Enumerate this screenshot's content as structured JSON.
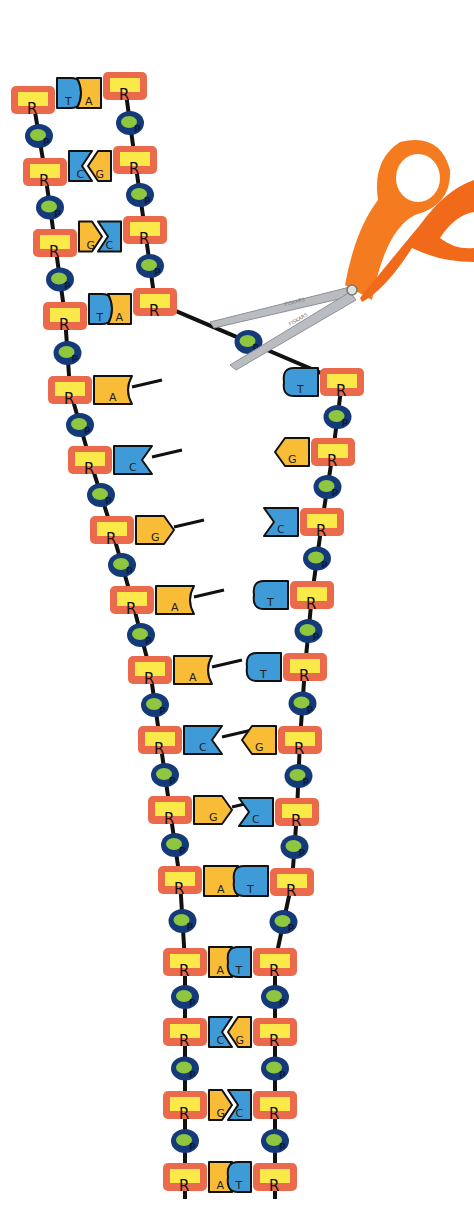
{
  "legend": {
    "sugar_label": "R",
    "phosphate_label": "P",
    "bases": [
      "A",
      "T",
      "C",
      "G"
    ]
  },
  "colors": {
    "sugar_outer": "#ec6a4c",
    "sugar_inner": "#fbe94a",
    "phosphate_outer": "#143a7a",
    "phosphate_inner": "#8ec63f",
    "backbone": "#111111",
    "purine": "#f9bc37",
    "pyrimidine": "#3f9ad8",
    "outline": "#111111",
    "scissor_handle": "#f47b20",
    "scissor_blade": "#b9bcc0",
    "scissor_brand": "#7a7a7a"
  },
  "scissors": {
    "brand": "FISKARS",
    "pivot": [
      352,
      290
    ]
  },
  "left_strand": {
    "nodes": [
      {
        "x": 33,
        "y": 100
      },
      {
        "x": 45,
        "y": 172
      },
      {
        "x": 55,
        "y": 243
      },
      {
        "x": 65,
        "y": 316
      },
      {
        "x": 70,
        "y": 390
      },
      {
        "x": 90,
        "y": 460
      },
      {
        "x": 112,
        "y": 530
      },
      {
        "x": 132,
        "y": 600
      },
      {
        "x": 150,
        "y": 670
      },
      {
        "x": 160,
        "y": 740
      },
      {
        "x": 170,
        "y": 810
      },
      {
        "x": 180,
        "y": 880
      },
      {
        "x": 185,
        "y": 962
      },
      {
        "x": 185,
        "y": 1032
      },
      {
        "x": 185,
        "y": 1105
      },
      {
        "x": 185,
        "y": 1177
      }
    ]
  },
  "right_strand": {
    "nodes": [
      {
        "x": 125,
        "y": 86
      },
      {
        "x": 135,
        "y": 160
      },
      {
        "x": 145,
        "y": 230
      },
      {
        "x": 155,
        "y": 302
      },
      {
        "x": 342,
        "y": 382
      },
      {
        "x": 333,
        "y": 452
      },
      {
        "x": 322,
        "y": 522
      },
      {
        "x": 312,
        "y": 595
      },
      {
        "x": 305,
        "y": 667
      },
      {
        "x": 300,
        "y": 740
      },
      {
        "x": 297,
        "y": 812
      },
      {
        "x": 292,
        "y": 882
      },
      {
        "x": 275,
        "y": 962
      },
      {
        "x": 275,
        "y": 1032
      },
      {
        "x": 275,
        "y": 1105
      },
      {
        "x": 275,
        "y": 1177
      }
    ]
  },
  "base_pairs": [
    {
      "left": "T",
      "right": "A",
      "paired": true
    },
    {
      "left": "C",
      "right": "G",
      "paired": true
    },
    {
      "left": "G",
      "right": "C",
      "paired": true
    },
    {
      "left": "T",
      "right": "A",
      "paired": true
    },
    {
      "left": "A",
      "right": "T",
      "paired": false
    },
    {
      "left": "C",
      "right": "G",
      "paired": false
    },
    {
      "left": "G",
      "right": "C",
      "paired": false
    },
    {
      "left": "A",
      "right": "T",
      "paired": false
    },
    {
      "left": "A",
      "right": "T",
      "paired": false
    },
    {
      "left": "C",
      "right": "G",
      "paired": false
    },
    {
      "left": "G",
      "right": "C",
      "paired": false
    },
    {
      "left": "A",
      "right": "T",
      "paired": true
    },
    {
      "left": "A",
      "right": "T",
      "paired": true
    },
    {
      "left": "C",
      "right": "G",
      "paired": true
    },
    {
      "left": "G",
      "right": "C",
      "paired": true
    },
    {
      "left": "A",
      "right": "T",
      "paired": true
    }
  ]
}
